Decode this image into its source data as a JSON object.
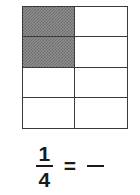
{
  "figure": {
    "kind": "equivalent-fraction-model",
    "model": {
      "columns": 2,
      "rows": 4,
      "total_parts": 8,
      "shaded_parts": 2,
      "shaded_cells": [
        0,
        2
      ],
      "shade_color": "#7a7a7a",
      "line_color": "#3a3a3a",
      "background_color": "#ffffff"
    },
    "equation": {
      "left_fraction": {
        "numerator": "1",
        "denominator": "4"
      },
      "operator": "=",
      "right_fraction": {
        "numerator": "",
        "denominator": ""
      }
    }
  }
}
